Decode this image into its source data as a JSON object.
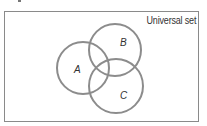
{
  "diagram": {
    "type": "venn",
    "universe_label": "Universal set",
    "sets": [
      {
        "id": "A",
        "label": "A",
        "cx": 83,
        "cy": 68,
        "r": 26,
        "label_x": 74,
        "label_y": 73
      },
      {
        "id": "B",
        "label": "B",
        "cx": 115,
        "cy": 50,
        "r": 26,
        "label_x": 120,
        "label_y": 46
      },
      {
        "id": "C",
        "label": "C",
        "cx": 116,
        "cy": 86,
        "r": 27,
        "label_x": 120,
        "label_y": 99
      }
    ],
    "colors": {
      "circle_stroke": "#8c8c8c",
      "frame_stroke": "#8a8a8a",
      "text": "#333333"
    }
  }
}
